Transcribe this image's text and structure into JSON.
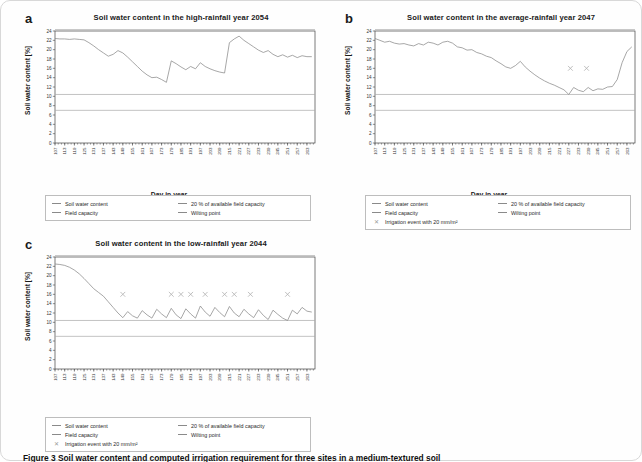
{
  "figure": {
    "caption": "Figure 3 Soil water content and computed irrigation requirement for three sites in a medium-textured soil",
    "axis": {
      "xlabel": "Day in year",
      "ylabel": "Soil water content [%]",
      "ylim": [
        0,
        24
      ],
      "yticks": [
        0,
        2,
        4,
        6,
        8,
        10,
        12,
        14,
        16,
        18,
        20,
        22,
        24
      ],
      "xticks": [
        107,
        113,
        119,
        125,
        131,
        137,
        143,
        149,
        155,
        161,
        167,
        173,
        179,
        185,
        191,
        197,
        203,
        209,
        215,
        221,
        227,
        233,
        239,
        245,
        251,
        257,
        263
      ],
      "xlim": [
        107,
        268
      ]
    },
    "reference_lines": {
      "field_capacity": 24.3,
      "twenty_pct_afc": 10.4,
      "wilting_point": 7.0
    },
    "legend_labels": {
      "soil_water_content": "Soil water content",
      "field_capacity": "Field capacity",
      "afc20": "20 % of available field capacity",
      "wilting_point": "Wilting point",
      "irrigation": "Irrigation event with 20 mm/m²"
    },
    "colors": {
      "series": "#8a8a8a",
      "reference": "#a9a9a9",
      "marker": "#b0b0b0",
      "axis": "#444444"
    }
  },
  "chart_data": [
    {
      "id": "a",
      "type": "line",
      "panel_letter": "a",
      "title": "Soil water content in the high-rainfall year 2054",
      "xlabel": "Day in year",
      "ylabel": "Soil water content [%]",
      "ylim": [
        0,
        24
      ],
      "xlim": [
        107,
        268
      ],
      "grid": false,
      "legend_position": "below",
      "irrigation_events": [],
      "x": [
        107,
        110,
        113,
        116,
        119,
        122,
        125,
        128,
        131,
        134,
        137,
        140,
        143,
        146,
        149,
        152,
        155,
        158,
        161,
        164,
        167,
        170,
        173,
        176,
        179,
        182,
        185,
        188,
        191,
        194,
        197,
        200,
        203,
        206,
        209,
        212,
        215,
        218,
        221,
        224,
        227,
        230,
        233,
        236,
        239,
        242,
        245,
        248,
        251,
        254,
        257,
        260,
        263,
        266
      ],
      "values": [
        22.4,
        22.3,
        22.3,
        22.2,
        22.3,
        22.2,
        22.1,
        21.5,
        20.8,
        20.0,
        19.3,
        18.6,
        19.0,
        19.8,
        19.3,
        18.4,
        17.4,
        16.4,
        15.4,
        14.6,
        14.0,
        14.1,
        13.6,
        13.0,
        17.6,
        17.0,
        16.3,
        15.7,
        16.4,
        15.9,
        17.2,
        16.4,
        15.9,
        15.5,
        15.2,
        15.0,
        21.5,
        22.3,
        22.9,
        22.0,
        21.3,
        20.6,
        19.9,
        19.4,
        19.8,
        19.0,
        18.5,
        18.9,
        18.4,
        18.8,
        18.3,
        18.7,
        18.5,
        18.5
      ]
    },
    {
      "id": "b",
      "type": "line",
      "panel_letter": "b",
      "title": "Soil water content in the average-rainfall year 2047",
      "xlabel": "Day in year",
      "ylabel": "Soil water content [%]",
      "ylim": [
        0,
        24
      ],
      "xlim": [
        107,
        268
      ],
      "grid": false,
      "legend_position": "below",
      "irrigation_events": [
        {
          "day": 228,
          "level": 16
        },
        {
          "day": 238,
          "level": 16
        }
      ],
      "x": [
        107,
        110,
        113,
        116,
        119,
        122,
        125,
        128,
        131,
        134,
        137,
        140,
        143,
        146,
        149,
        152,
        155,
        158,
        161,
        164,
        167,
        170,
        173,
        176,
        179,
        182,
        185,
        188,
        191,
        194,
        197,
        200,
        203,
        206,
        209,
        212,
        215,
        218,
        221,
        224,
        227,
        230,
        233,
        236,
        239,
        242,
        245,
        248,
        251,
        254,
        257,
        260,
        263,
        266
      ],
      "values": [
        22.4,
        22.0,
        21.6,
        21.8,
        21.4,
        21.2,
        21.3,
        21.0,
        20.8,
        21.3,
        21.0,
        21.6,
        21.4,
        21.0,
        21.6,
        21.8,
        21.4,
        20.6,
        20.4,
        19.9,
        20.0,
        19.4,
        19.1,
        18.6,
        18.3,
        17.6,
        17.0,
        16.3,
        16.0,
        16.6,
        17.5,
        16.3,
        15.4,
        14.6,
        13.9,
        13.3,
        12.8,
        12.4,
        11.9,
        11.4,
        10.4,
        11.9,
        11.3,
        11.0,
        11.9,
        11.2,
        11.6,
        11.5,
        12.0,
        12.1,
        13.6,
        17.2,
        19.6,
        20.6
      ]
    },
    {
      "id": "c",
      "type": "line",
      "panel_letter": "c",
      "title": "Soil water content in the low-rainfall year 2044",
      "xlabel": "Day in year",
      "ylabel": "Soil water content [%]",
      "ylim": [
        0,
        24
      ],
      "xlim": [
        107,
        268
      ],
      "grid": false,
      "legend_position": "below",
      "irrigation_events": [
        {
          "day": 149,
          "level": 16
        },
        {
          "day": 179,
          "level": 16
        },
        {
          "day": 185,
          "level": 16
        },
        {
          "day": 191,
          "level": 16
        },
        {
          "day": 200,
          "level": 16
        },
        {
          "day": 212,
          "level": 16
        },
        {
          "day": 218,
          "level": 16
        },
        {
          "day": 228,
          "level": 16
        },
        {
          "day": 251,
          "level": 16
        }
      ],
      "x": [
        107,
        110,
        113,
        116,
        119,
        122,
        125,
        128,
        131,
        134,
        137,
        140,
        143,
        146,
        149,
        152,
        155,
        158,
        161,
        164,
        167,
        170,
        173,
        176,
        179,
        182,
        185,
        188,
        191,
        194,
        197,
        200,
        203,
        206,
        209,
        212,
        215,
        218,
        221,
        224,
        227,
        230,
        233,
        236,
        239,
        242,
        245,
        248,
        251,
        254,
        257,
        260,
        263,
        266
      ],
      "values": [
        22.5,
        22.4,
        22.2,
        21.8,
        21.2,
        20.4,
        19.4,
        18.3,
        17.2,
        16.4,
        15.6,
        14.4,
        13.2,
        12.0,
        11.0,
        12.3,
        11.4,
        10.9,
        12.5,
        11.6,
        10.9,
        12.8,
        11.8,
        11.0,
        13.0,
        11.6,
        10.8,
        12.9,
        11.8,
        10.9,
        13.5,
        12.2,
        11.3,
        13.2,
        12.1,
        11.2,
        13.4,
        12.0,
        11.2,
        12.8,
        11.8,
        11.0,
        12.7,
        11.5,
        10.6,
        12.6,
        11.7,
        10.9,
        10.4,
        12.6,
        11.8,
        13.2,
        12.4,
        12.2
      ]
    }
  ]
}
